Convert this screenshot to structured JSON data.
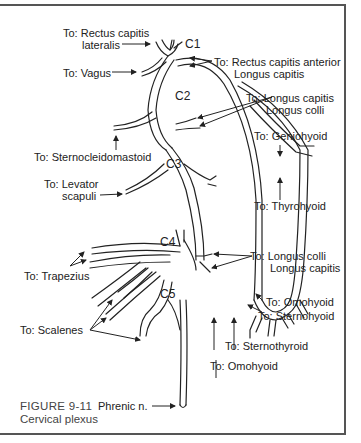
{
  "figure": {
    "number": "FIGURE 9-11",
    "title": "Cervical plexus"
  },
  "roots": [
    {
      "id": "c1",
      "label": "C1"
    },
    {
      "id": "c2",
      "label": "C2"
    },
    {
      "id": "c3",
      "label": "C3"
    },
    {
      "id": "c4",
      "label": "C4"
    },
    {
      "id": "c5",
      "label": "C5"
    }
  ],
  "labels": {
    "rectus_lateralis_1": "To: Rectus capitis",
    "rectus_lateralis_2": "lateralis",
    "vagus": "To: Vagus",
    "rectus_anterior_1": "To: Rectus capitis anterior",
    "rectus_anterior_2": "Longus capitis",
    "longus_upper_1": "To: Longus capitis",
    "longus_upper_2": "Longus colli",
    "sternocleidomastoid": "To: Sternocleidomastoid",
    "geniohyoid": "To: Geniohyoid",
    "levator_1": "To: Levator",
    "levator_2": "scapuli",
    "thyrohyoid": "To: Thyrohyoid",
    "trapezius": "To: Trapezius",
    "longus_lower_1": "To: Longus colli",
    "longus_lower_2": "Longus capitis",
    "omohyoid_upper": "To: Omohyoid",
    "sternohyoid": "To: Sternohyoid",
    "scalenes": "To: Scalenes",
    "sternothyroid": "To: Sternothyroid",
    "omohyoid_lower": "To: Omohyoid",
    "phrenic": "Phrenic n."
  }
}
